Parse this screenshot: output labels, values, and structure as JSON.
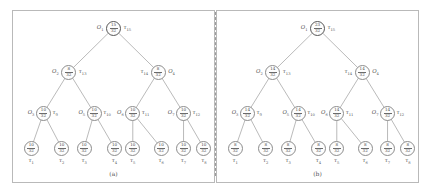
{
  "figure": {
    "divider_style": "dashed-vertical",
    "panels": [
      {
        "id": "a",
        "caption": "(a)",
        "nodes": [
          {
            "key": "O1",
            "o_label": "O",
            "o_sub": "1",
            "t_label": "τ",
            "t_sub": "15",
            "num": "15",
            "den": "32",
            "level": 0,
            "side": "right"
          },
          {
            "key": "O2",
            "o_label": "O",
            "o_sub": "2",
            "t_label": "τ",
            "t_sub": "13",
            "num": "8",
            "den": "32",
            "level": 1,
            "side": "right"
          },
          {
            "key": "O4",
            "o_label": "O",
            "o_sub": "4",
            "t_label": "τ",
            "t_sub": "14",
            "num": "8",
            "den": "32",
            "level": 1,
            "side": "left"
          },
          {
            "key": "O3",
            "o_label": "O",
            "o_sub": "3",
            "t_label": "τ",
            "t_sub": "9",
            "num": "10",
            "den": "32",
            "level": 2,
            "side": "right"
          },
          {
            "key": "O5",
            "o_label": "O",
            "o_sub": "5",
            "t_label": "τ",
            "t_sub": "10",
            "num": "10",
            "den": "32",
            "level": 2,
            "side": "right"
          },
          {
            "key": "O6",
            "o_label": "O",
            "o_sub": "6",
            "t_label": "τ",
            "t_sub": "11",
            "num": "10",
            "den": "32",
            "level": 2,
            "side": "right"
          },
          {
            "key": "O7",
            "o_label": "O",
            "o_sub": "7",
            "t_label": "τ",
            "t_sub": "12",
            "num": "10",
            "den": "32",
            "level": 2,
            "side": "right"
          }
        ],
        "leaves": [
          {
            "key": "L1",
            "label": "τ",
            "sub": "1",
            "num": "10",
            "den": "32"
          },
          {
            "key": "L2",
            "label": "τ",
            "sub": "2",
            "num": "10",
            "den": "32"
          },
          {
            "key": "L3",
            "label": "τ",
            "sub": "3",
            "num": "10",
            "den": "32"
          },
          {
            "key": "L4",
            "label": "τ",
            "sub": "4",
            "num": "10",
            "den": "32"
          },
          {
            "key": "L5",
            "label": "τ",
            "sub": "5",
            "num": "10",
            "den": "32"
          },
          {
            "key": "L6",
            "label": "τ",
            "sub": "6",
            "num": "10",
            "den": "32"
          },
          {
            "key": "L7",
            "label": "τ",
            "sub": "7",
            "num": "10",
            "den": "32"
          },
          {
            "key": "L8",
            "label": "τ",
            "sub": "8",
            "num": "10",
            "den": "32"
          }
        ]
      },
      {
        "id": "b",
        "caption": "(b)",
        "nodes": [
          {
            "key": "O1",
            "o_label": "O",
            "o_sub": "1",
            "t_label": "τ",
            "t_sub": "15",
            "num": "23",
            "den": "32",
            "level": 0,
            "side": "right"
          },
          {
            "key": "O2",
            "o_label": "O",
            "o_sub": "2",
            "t_label": "τ",
            "t_sub": "13",
            "num": "14",
            "den": "32",
            "level": 1,
            "side": "right"
          },
          {
            "key": "O4",
            "o_label": "O",
            "o_sub": "4",
            "t_label": "τ",
            "t_sub": "14",
            "num": "14",
            "den": "32",
            "level": 1,
            "side": "left"
          },
          {
            "key": "O3",
            "o_label": "O",
            "o_sub": "3",
            "t_label": "τ",
            "t_sub": "9",
            "num": "14",
            "den": "32",
            "level": 2,
            "side": "right"
          },
          {
            "key": "O5",
            "o_label": "O",
            "o_sub": "5",
            "t_label": "τ",
            "t_sub": "10",
            "num": "14",
            "den": "32",
            "level": 2,
            "side": "right"
          },
          {
            "key": "O6",
            "o_label": "O",
            "o_sub": "6",
            "t_label": "τ",
            "t_sub": "11",
            "num": "14",
            "den": "32",
            "level": 2,
            "side": "right"
          },
          {
            "key": "O7",
            "o_label": "O",
            "o_sub": "7",
            "t_label": "τ",
            "t_sub": "12",
            "num": "14",
            "den": "32",
            "level": 2,
            "side": "right"
          }
        ],
        "leaves": [
          {
            "key": "L1",
            "label": "τ",
            "sub": "1",
            "num": "8",
            "den": "32"
          },
          {
            "key": "L2",
            "label": "τ",
            "sub": "2",
            "num": "8",
            "den": "32"
          },
          {
            "key": "L3",
            "label": "τ",
            "sub": "3",
            "num": "8",
            "den": "32"
          },
          {
            "key": "L4",
            "label": "τ",
            "sub": "4",
            "num": "8",
            "den": "32"
          },
          {
            "key": "L5",
            "label": "τ",
            "sub": "5",
            "num": "8",
            "den": "32"
          },
          {
            "key": "L6",
            "label": "τ",
            "sub": "6",
            "num": "8",
            "den": "32"
          },
          {
            "key": "L7",
            "label": "τ",
            "sub": "7",
            "num": "8",
            "den": "32"
          },
          {
            "key": "L8",
            "label": "τ",
            "sub": "8",
            "num": "8",
            "den": "32"
          }
        ]
      }
    ]
  }
}
